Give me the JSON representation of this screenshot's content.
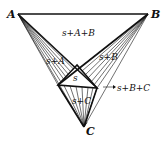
{
  "diagram": {
    "type": "ternary-phase-diagram",
    "vertices": {
      "A": {
        "label": "A",
        "x": 18,
        "y": 14
      },
      "B": {
        "label": "B",
        "x": 148,
        "y": 14
      },
      "C": {
        "label": "C",
        "x": 84,
        "y": 127
      }
    },
    "inner_triangle": {
      "label": "s",
      "points": [
        [
          77,
          65
        ],
        [
          58,
          85
        ],
        [
          97,
          88
        ]
      ]
    },
    "regions": [
      {
        "id": "s-a-b",
        "label": "s+A+B"
      },
      {
        "id": "s-a",
        "label": "s+A"
      },
      {
        "id": "s-b",
        "label": "s+B"
      },
      {
        "id": "s",
        "label": "s"
      },
      {
        "id": "s-b-c",
        "label": "s+B+C"
      },
      {
        "id": "s-c",
        "label": "s+C"
      }
    ]
  },
  "labels": {
    "A": "A",
    "B": "B",
    "C": "C",
    "s_A_B": "s+A+B",
    "s_A": "s+A",
    "s_B": "s+B",
    "s": "s",
    "s_B_C": "s+B+C",
    "s_C": "s+C"
  }
}
